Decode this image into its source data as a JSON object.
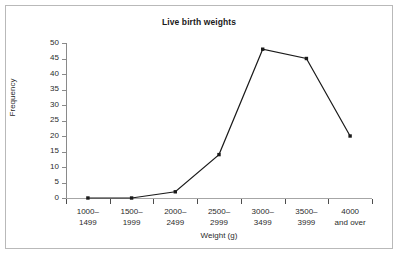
{
  "chart_data": {
    "type": "line",
    "title": "Live birth weights",
    "xlabel": "Weight (g)",
    "ylabel": "Frequency",
    "categories": [
      "1000–\n1499",
      "1500–\n1999",
      "2000–\n2499",
      "2500–\n2999",
      "3000–\n3499",
      "3500–\n3999",
      "4000\nand over"
    ],
    "category_lines": [
      [
        "1000–",
        "1499"
      ],
      [
        "1500–",
        "1999"
      ],
      [
        "2000–",
        "2499"
      ],
      [
        "2500–",
        "2999"
      ],
      [
        "3000–",
        "3499"
      ],
      [
        "3500–",
        "3999"
      ],
      [
        "4000",
        "and over"
      ]
    ],
    "values": [
      0,
      0,
      2,
      14,
      48,
      45,
      20
    ],
    "ylim": [
      0,
      50
    ],
    "yticks": [
      0,
      5,
      10,
      15,
      20,
      25,
      30,
      35,
      40,
      45,
      50
    ],
    "ytick_labels": [
      "0",
      "5",
      "10",
      "15",
      "20",
      "25",
      "30",
      "35",
      "40",
      "45",
      "50"
    ],
    "grid": false,
    "legend": null,
    "line_color": "#1a1a1a",
    "marker": "square",
    "marker_color": "#1a1a1a",
    "axis_color": "#8a8a8a",
    "border_color": "#b9b9b9",
    "background": "#ffffff"
  }
}
